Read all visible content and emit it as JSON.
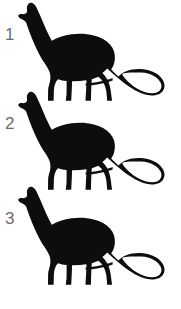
{
  "image": {
    "title": "Three numbered dinosaur silhouettes",
    "background_color": "#ffffff",
    "silhouette_color": "#0d0d0d",
    "label_color": "#6b6b6b",
    "width": 181,
    "height": 309
  },
  "items": [
    {
      "label": "1",
      "subject": "dinosaur-silhouette",
      "species_hint": "sauropod"
    },
    {
      "label": "2",
      "subject": "dinosaur-silhouette",
      "species_hint": "sauropod"
    },
    {
      "label": "3",
      "subject": "dinosaur-silhouette",
      "species_hint": "sauropod"
    }
  ]
}
